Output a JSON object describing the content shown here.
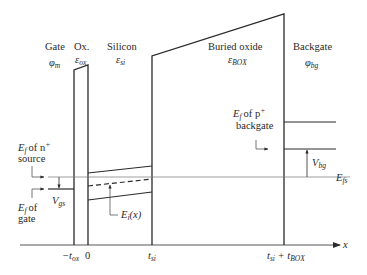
{
  "diagram": {
    "regions": [
      {
        "id": "gate",
        "name": "Gate",
        "symbol": "φ",
        "symbol_sub": "m"
      },
      {
        "id": "oxide",
        "name": "Ox.",
        "symbol": "ε",
        "symbol_sub": "ox"
      },
      {
        "id": "silicon",
        "name": "Silicon",
        "symbol": "ε",
        "symbol_sub": "si"
      },
      {
        "id": "box",
        "name": "Buried oxide",
        "symbol": "ε",
        "symbol_sub": "BOX"
      },
      {
        "id": "backgate",
        "name": "Backgate",
        "symbol": "φ",
        "symbol_sub": "bg"
      }
    ],
    "annotations": {
      "ef_source_line1": "of n",
      "ef_source_sup": "+",
      "ef_source_line2": "source",
      "ef_gate_line1": "of",
      "ef_gate_line2": "gate",
      "ef_backgate_line1": "of p",
      "ef_backgate_sup": "+",
      "ef_backgate_line2": "backgate",
      "E": "E",
      "f": "f",
      "vgs_V": "V",
      "vgs_sub": "gs",
      "vbg_V": "V",
      "vbg_sub": "bg",
      "efs_E": "E",
      "efs_sub": "fs",
      "ei_E": "E",
      "ei_sub": "i",
      "ei_arg": "(x)"
    },
    "axis": {
      "label": "x",
      "ticks": [
        {
          "label": "−t",
          "sub": "ox"
        },
        {
          "label": "0"
        },
        {
          "label": "t",
          "sub": "si"
        },
        {
          "label": "t",
          "sub": "si",
          "plus": " + t",
          "sub2": "BOX"
        }
      ]
    },
    "colors": {
      "line": "#2a2a2a",
      "thin_line": "#555555"
    }
  }
}
